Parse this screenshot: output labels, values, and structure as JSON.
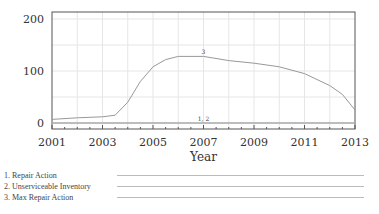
{
  "chart_data": {
    "type": "line",
    "title": "",
    "xlabel": "Year",
    "ylabel": "",
    "xlim": [
      2001,
      2013
    ],
    "ylim": [
      0,
      200
    ],
    "x_ticks": [
      "2001",
      "2003",
      "2005",
      "2007",
      "2009",
      "2011",
      "2013"
    ],
    "y_ticks": [
      "0",
      "100",
      "200"
    ],
    "grid": true,
    "legend_position": "bottom",
    "series": [
      {
        "id": "1",
        "name": "Repair Action",
        "x": [
          2001,
          2003,
          2005,
          2007,
          2009,
          2011,
          2013
        ],
        "values": [
          0,
          0,
          0,
          0,
          0,
          0,
          0
        ]
      },
      {
        "id": "2",
        "name": "Unserviceable Inventory",
        "x": [
          2001,
          2003,
          2005,
          2007,
          2009,
          2011,
          2013
        ],
        "values": [
          0,
          0,
          0,
          0,
          0,
          0,
          0
        ]
      },
      {
        "id": "3",
        "name": "Max Repair Action",
        "x": [
          2001,
          2002,
          2003,
          2003.5,
          2004,
          2004.5,
          2005,
          2005.5,
          2006,
          2007,
          2008,
          2009,
          2010,
          2011,
          2012,
          2012.5,
          2013
        ],
        "values": [
          7,
          10,
          12,
          15,
          40,
          80,
          108,
          122,
          128,
          128,
          120,
          115,
          108,
          95,
          72,
          55,
          25
        ]
      }
    ],
    "annotations": [
      {
        "text": "3",
        "x": 2007,
        "y": 133
      },
      {
        "text": "1, 2",
        "x": 2007,
        "y": 4
      }
    ]
  },
  "legend": {
    "items": [
      {
        "label": "1. Repair Action"
      },
      {
        "label": "2. Unserviceable Inventory"
      },
      {
        "label": "3. Max Repair Action"
      }
    ]
  }
}
